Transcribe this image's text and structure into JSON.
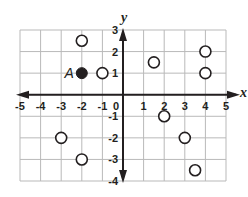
{
  "chart_data": {
    "type": "scatter",
    "title": "",
    "xlabel": "x",
    "ylabel": "y",
    "xlim": [
      -5,
      5
    ],
    "ylim": [
      -4,
      3
    ],
    "grid": true,
    "x_ticks": [
      -5,
      -4,
      -3,
      -2,
      -1,
      0,
      1,
      2,
      3,
      4,
      5
    ],
    "y_ticks": [
      -4,
      -3,
      -2,
      -1,
      1,
      2,
      3
    ],
    "x_tick_labels": [
      "-5",
      "-4",
      "-3",
      "-2",
      "-1",
      "0",
      "1",
      "2",
      "3",
      "4",
      "5"
    ],
    "y_tick_labels": [
      "-4",
      "-3",
      "-2",
      "-1",
      "1",
      "2",
      "3"
    ],
    "labeled_points": [
      {
        "label": "A",
        "x": -2,
        "y": 1,
        "style": "filled"
      }
    ],
    "open_points": [
      {
        "x": -2,
        "y": 2.5
      },
      {
        "x": -1,
        "y": 1
      },
      {
        "x": 1.5,
        "y": 1.5
      },
      {
        "x": 4,
        "y": 2
      },
      {
        "x": 4,
        "y": 1
      },
      {
        "x": -3,
        "y": -2
      },
      {
        "x": -2,
        "y": -3
      },
      {
        "x": 2,
        "y": -1
      },
      {
        "x": 3,
        "y": -2
      },
      {
        "x": 3.5,
        "y": -3.5
      }
    ]
  },
  "colors": {
    "grid": "#b9b9b9",
    "axis": "#231f20",
    "point": "#231f20"
  },
  "layout": {
    "left": 20,
    "right": 226,
    "top": 30,
    "bottom": 181
  }
}
